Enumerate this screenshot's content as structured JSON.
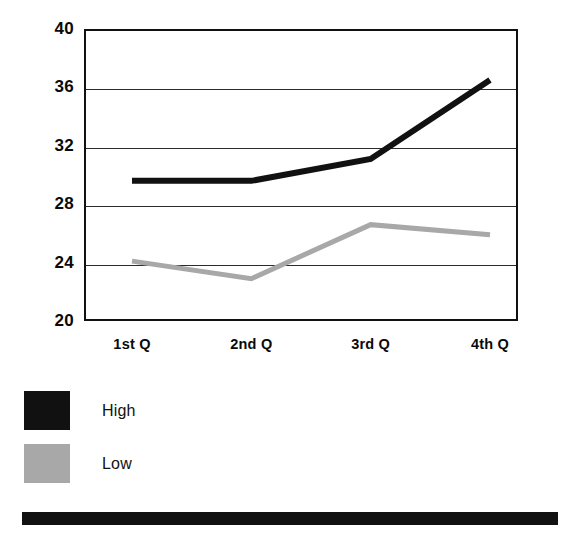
{
  "chart_data": {
    "type": "line",
    "title": "",
    "subtitle": "",
    "xlabel": "",
    "ylabel": "",
    "categories": [
      "1st Q",
      "2nd Q",
      "3rd Q",
      "4th Q"
    ],
    "series": [
      {
        "name": "High",
        "color": "#111111",
        "values": [
          29.6,
          29.6,
          31.1,
          36.5
        ]
      },
      {
        "name": "Low",
        "color": "#a8a8a8",
        "values": [
          24.1,
          22.9,
          26.6,
          25.9
        ]
      }
    ],
    "ylim": [
      20,
      40
    ],
    "yticks": [
      20,
      24,
      28,
      32,
      36,
      40
    ],
    "ytick_labels": [
      "20",
      "24",
      "28",
      "32",
      "36",
      "40"
    ],
    "grid": true,
    "grid_axis": "y",
    "legend_position": "bottom-left",
    "legend": [
      {
        "label": "High",
        "color": "#111111"
      },
      {
        "label": "Low",
        "color": "#a8a8a8"
      }
    ]
  },
  "decoration": {
    "bottom_bar_color": "#111111"
  }
}
